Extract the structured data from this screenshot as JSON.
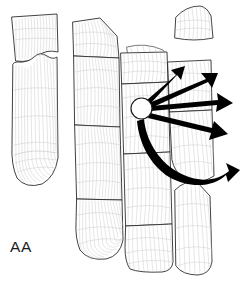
{
  "figure": {
    "label": "AA",
    "label_position": {
      "x": 10,
      "y": 252
    },
    "background_color": "#ffffff",
    "outline_color": "#2b2b2b",
    "contour_color": "#c4c4c4",
    "arrow_color": "#000000",
    "hub_fill_color": "#ffffff",
    "width": 243,
    "height": 290
  },
  "hub": {
    "name": "impact-origin-circle",
    "center_x": 141.5,
    "center_y": 108.5,
    "radius": 10.5
  },
  "arrows": [
    {
      "id": "arrow-1",
      "label": "up-right-steep",
      "angle_deg": -61,
      "tip_x": 183,
      "tip_y": 67,
      "weight": "thin"
    },
    {
      "id": "arrow-2",
      "label": "up-right-shallow",
      "angle_deg": -33,
      "tip_x": 225,
      "tip_y": 78,
      "weight": "medium"
    },
    {
      "id": "arrow-3",
      "label": "right-horizontal",
      "angle_deg": -4,
      "tip_x": 236,
      "tip_y": 103,
      "weight": "medium"
    },
    {
      "id": "arrow-4",
      "label": "down-right-shallow",
      "angle_deg": 22,
      "tip_x": 233,
      "tip_y": 137,
      "weight": "medium"
    },
    {
      "id": "arrow-5",
      "label": "down-right-curved-broad",
      "angle_deg": 58,
      "tip_x": 240,
      "tip_y": 180,
      "weight": "broad-curved"
    }
  ],
  "panels": [
    {
      "id": "panel-left-upper",
      "name": "left-upper-fragment"
    },
    {
      "id": "panel-left-lower",
      "name": "left-lower-fragment"
    },
    {
      "id": "panel-center-upper",
      "name": "center-upper-block"
    },
    {
      "id": "panel-center-middle",
      "name": "center-middle-block"
    },
    {
      "id": "panel-center-lower",
      "name": "center-lower-block"
    },
    {
      "id": "panel-center-foot",
      "name": "center-foot-block"
    },
    {
      "id": "panel-main-upper",
      "name": "main-upper-block"
    },
    {
      "id": "panel-main-middle",
      "name": "main-middle-block"
    },
    {
      "id": "panel-main-lower",
      "name": "main-lower-block"
    },
    {
      "id": "panel-main-foot",
      "name": "main-foot-block"
    },
    {
      "id": "panel-right-upper",
      "name": "right-upper-block"
    },
    {
      "id": "panel-right-lower",
      "name": "right-lower-block"
    },
    {
      "id": "panel-top-detached",
      "name": "top-detached-fragment"
    },
    {
      "id": "panel-bottom-right",
      "name": "bottom-right-fragment"
    },
    {
      "id": "panel-sliver",
      "name": "upper-sliver-fragment"
    }
  ]
}
